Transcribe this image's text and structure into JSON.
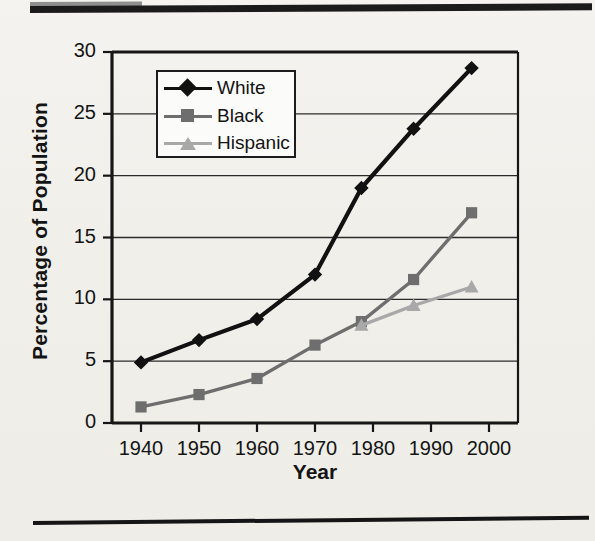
{
  "page": {
    "background_color": "#f1f0eb",
    "top_rule_color": "#1b1b1b",
    "bottom_rule_color": "#151515"
  },
  "chart_data": {
    "type": "line",
    "title": "",
    "xlabel": "Year",
    "ylabel": "Percentage of Population",
    "xlim": [
      1935,
      2005
    ],
    "ylim": [
      0,
      30
    ],
    "ytick_labels": [
      "0",
      "5",
      "10",
      "15",
      "20",
      "25",
      "30"
    ],
    "ytick_values": [
      0,
      5,
      10,
      15,
      20,
      25,
      30
    ],
    "xtick_labels": [
      "1940",
      "1950",
      "1960",
      "1970",
      "1980",
      "1990",
      "2000"
    ],
    "xtick_values": [
      1940,
      1950,
      1960,
      1970,
      1980,
      1990,
      2000
    ],
    "grid": "horizontal",
    "legend_position": "upper-left-inside",
    "series": [
      {
        "name": "White",
        "color": "#111111",
        "marker": "diamond",
        "x": [
          1940,
          1950,
          1960,
          1970,
          1978,
          1987,
          1997
        ],
        "values": [
          4.9,
          6.7,
          8.4,
          12.0,
          19.0,
          23.8,
          28.7
        ]
      },
      {
        "name": "Black",
        "color": "#6e6e6e",
        "marker": "square",
        "x": [
          1940,
          1950,
          1960,
          1970,
          1978,
          1987,
          1997
        ],
        "values": [
          1.3,
          2.3,
          3.6,
          6.3,
          8.2,
          11.6,
          17.0
        ]
      },
      {
        "name": "Hispanic",
        "color": "#a8a8a8",
        "marker": "triangle",
        "x": [
          1978,
          1987,
          1997
        ],
        "values": [
          7.9,
          9.5,
          11.0
        ]
      }
    ]
  },
  "legend": {
    "items": [
      {
        "label": "White",
        "color": "#111111",
        "marker": "diamond"
      },
      {
        "label": "Black",
        "color": "#6e6e6e",
        "marker": "square"
      },
      {
        "label": "Hispanic",
        "color": "#a8a8a8",
        "marker": "triangle"
      }
    ]
  }
}
